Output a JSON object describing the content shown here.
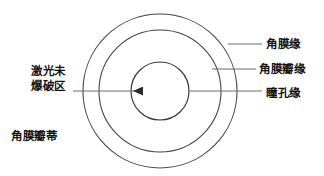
{
  "figure": {
    "type": "concentric-circle-anatomy-diagram",
    "background_color": "#ffffff",
    "stroke_color": "#3a3a3a",
    "text_color": "#111111"
  },
  "labels": {
    "limbus": "角膜缘",
    "flap_edge": "角膜瓣缘",
    "pupil_edge": "瞳孔缘",
    "no_laser_line1": "激光未",
    "no_laser_line2": "爆破区",
    "flap_hinge": "角膜瓣蒂"
  },
  "geometry": {
    "center_x": 160,
    "center_y": 91,
    "outer_radius": 77,
    "middle_radius": 61,
    "inner_radius": 29
  }
}
